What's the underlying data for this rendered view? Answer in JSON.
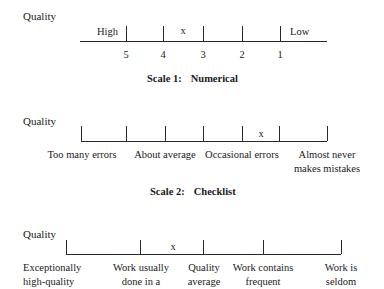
{
  "scale1": {
    "title_label": "Quality",
    "left_anchor": "High",
    "right_anchor": "Low",
    "mark": "x",
    "numbers": [
      "5",
      "4",
      "3",
      "2",
      "1"
    ],
    "caption_prefix": "Scale 1:",
    "caption_name": "Numerical"
  },
  "scale2": {
    "title_label": "Quality",
    "mark": "x",
    "labels": [
      {
        "line1": "Too many errors",
        "line2": ""
      },
      {
        "line1": "About average",
        "line2": ""
      },
      {
        "line1": "Occasional errors",
        "line2": ""
      },
      {
        "line1": "Almost never",
        "line2": "makes mistakes"
      }
    ],
    "caption_prefix": "Scale 2:",
    "caption_name": "Checklist"
  },
  "scale3": {
    "title_label": "Quality",
    "mark": "x",
    "labels": [
      {
        "line1": "Exceptionally",
        "line2": "high-quality"
      },
      {
        "line1": "Work usually",
        "line2": "done in a"
      },
      {
        "line1": "Quality",
        "line2": "average"
      },
      {
        "line1": "Work contains",
        "line2": "frequent"
      },
      {
        "line1": "Work is",
        "line2": "seldom"
      }
    ]
  }
}
